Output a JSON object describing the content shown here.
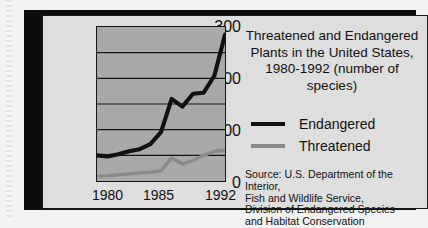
{
  "figure": {
    "title_lines": [
      "Threatened and Endangered",
      "Plants in the United States,",
      "1980-1992 (number of species)"
    ],
    "source_lines": [
      "Source: U.S. Department of the Interior,",
      "Fish and Wildlife Service,",
      "Division of Endangered Species",
      "and Habitat Conservation"
    ]
  },
  "legend": {
    "entries": [
      {
        "label": "Endangered",
        "color": "#111111"
      },
      {
        "label": "Threatened",
        "color": "#8a8a8a"
      }
    ]
  },
  "colors": {
    "plot_background": "#a9a9a9",
    "panel_background": "#dedede",
    "page_background": "#f2f2f0",
    "frame": "#111111",
    "endangered": "#111111",
    "threatened": "#8a8a8a"
  },
  "chart_data": {
    "type": "line",
    "title": "Threatened and Endangered Plants in the United States, 1980-1992 (number of species)",
    "xlabel": "",
    "ylabel": "",
    "x": [
      1980,
      1981,
      1982,
      1983,
      1984,
      1985,
      1986,
      1987,
      1988,
      1989,
      1990,
      1991,
      1992
    ],
    "xlim": [
      1980,
      1992
    ],
    "ylim": [
      0,
      300
    ],
    "yticks": [
      0,
      100,
      200,
      300
    ],
    "ytick_labels": [
      "0",
      "100",
      "200",
      "300"
    ],
    "xticks": [
      1980,
      1985,
      1992
    ],
    "xtick_labels": [
      "1980",
      "1985",
      "1992"
    ],
    "gridlines_y": [
      50,
      100,
      150,
      200,
      250
    ],
    "grid": true,
    "legend_position": "right",
    "series": [
      {
        "name": "Endangered",
        "color": "#111111",
        "values": [
          50,
          48,
          52,
          58,
          62,
          72,
          95,
          160,
          145,
          170,
          172,
          205,
          285
        ]
      },
      {
        "name": "Threatened",
        "color": "#8a8a8a",
        "values": [
          9,
          10,
          12,
          14,
          16,
          17,
          20,
          45,
          33,
          40,
          50,
          58,
          60
        ]
      }
    ]
  }
}
